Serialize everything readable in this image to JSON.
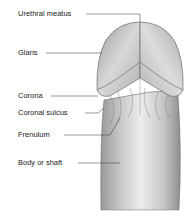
{
  "diagram": {
    "labels": [
      {
        "id": "urethral-meatus",
        "text": "Urethral meatus"
      },
      {
        "id": "glans",
        "text": "Glans"
      },
      {
        "id": "corona",
        "text": "Corona"
      },
      {
        "id": "coronal-sulcus",
        "text": "Coronal sulcus"
      },
      {
        "id": "frenulum",
        "text": "Frenulum"
      },
      {
        "id": "body-or-shaft",
        "text": "Body or shaft"
      }
    ]
  }
}
